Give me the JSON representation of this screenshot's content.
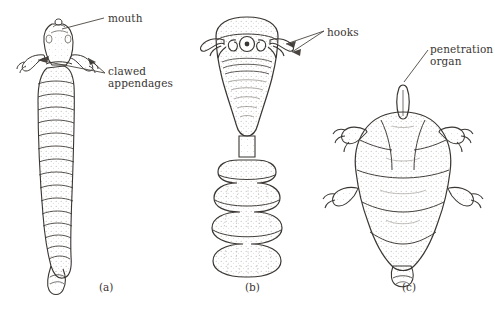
{
  "figure": {
    "background_color": "#ffffff",
    "ink_color": "#3a3633",
    "type": "scientific-line-illustration",
    "panels": [
      {
        "caption": "(a)",
        "subject": "elongate annelid-like larva with segmented trunk",
        "labels": [
          "mouth",
          "clawed appendages"
        ]
      },
      {
        "caption": "(b)",
        "subject": "bell-headed larva with hooks and tiered bulging trunk",
        "labels": [
          "hooks"
        ]
      },
      {
        "caption": "(c)",
        "subject": "plump tardigrade-like larva with four pairs of clawed legs",
        "labels": [
          "penetration organ"
        ]
      }
    ]
  },
  "labels": {
    "mouth": "mouth",
    "clawed_appendages": "clawed\nappendages",
    "hooks": "hooks",
    "penetration_organ": "penetration\norgan"
  },
  "captions": {
    "a": "(a)",
    "b": "(b)",
    "c": "(c)"
  }
}
